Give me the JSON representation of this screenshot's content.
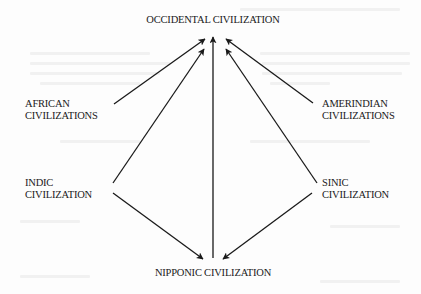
{
  "diagram": {
    "nodes": {
      "occidental": {
        "line1": "OCCIDENTAL CIVILIZATION"
      },
      "african": {
        "line1": "AFRICAN",
        "line2": "CIVILIZATIONS"
      },
      "amerindian": {
        "line1": "AMERINDIAN",
        "line2": "CIVILIZATIONS"
      },
      "indic": {
        "line1": "INDIC",
        "line2": "CIVILIZATION"
      },
      "sinic": {
        "line1": "SINIC",
        "line2": "CIVILIZATION"
      },
      "nipponic": {
        "line1": "NIPPONIC CIVILIZATION"
      }
    },
    "edges": [
      {
        "from": "AFRICAN CIVILIZATIONS",
        "to": "OCCIDENTAL CIVILIZATION"
      },
      {
        "from": "INDIC CIVILIZATION",
        "to": "OCCIDENTAL CIVILIZATION"
      },
      {
        "from": "NIPPONIC CIVILIZATION",
        "to": "OCCIDENTAL CIVILIZATION"
      },
      {
        "from": "SINIC CIVILIZATION",
        "to": "OCCIDENTAL CIVILIZATION"
      },
      {
        "from": "AMERINDIAN CIVILIZATIONS",
        "to": "OCCIDENTAL CIVILIZATION"
      },
      {
        "from": "INDIC CIVILIZATION",
        "to": "NIPPONIC CIVILIZATION"
      },
      {
        "from": "SINIC CIVILIZATION",
        "to": "NIPPONIC CIVILIZATION"
      }
    ],
    "colors": {
      "ink": "#1a1a1a",
      "paper": "#fdfdfd"
    }
  }
}
